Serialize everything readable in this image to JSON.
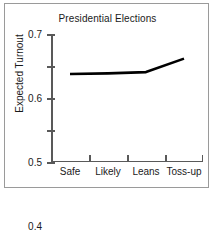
{
  "chart_data": {
    "type": "line",
    "title": "Presidential Elections",
    "xlabel": "",
    "ylabel": "Expected Turnout",
    "categories": [
      "Safe",
      "Likely",
      "Leans",
      "Toss-up"
    ],
    "values": [
      0.575,
      0.577,
      0.581,
      0.623
    ],
    "series": [
      {
        "name": "Expected Turnout",
        "values": [
          0.575,
          0.577,
          0.581,
          0.623
        ]
      }
    ],
    "ylim": [
      0.3,
      0.7
    ],
    "yticks": [
      0.3,
      0.4,
      0.5,
      0.6,
      0.7
    ],
    "ytick_labels": [
      "0.3",
      "0.4",
      "0.5",
      "0.6",
      "0.7"
    ],
    "grid": false,
    "legend": false,
    "line_color": "#000000"
  }
}
